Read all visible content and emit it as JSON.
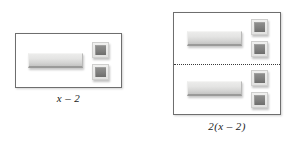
{
  "background_color": "#ffffff",
  "colors": {
    "panel_border": "#6e6e6e",
    "divider": "#3a3a3a",
    "bar_tile_fill": "#e4e4e3",
    "bar_tile_shadow_edge": "#9a9a99",
    "unit_tile_fill": "#7e7e7d",
    "unit_tile_frame": "#e2e2e1",
    "caption_text": "#1a1a1a"
  },
  "diagram": {
    "type": "algebra-tiles",
    "groups": [
      {
        "id": "group-left",
        "caption": "x – 2",
        "halves": 1,
        "divider": false,
        "tiles": {
          "bar_tiles": 1,
          "unit_tiles": 2
        }
      },
      {
        "id": "group-right",
        "caption": "2(x – 2)",
        "halves": 2,
        "divider": true,
        "tiles": {
          "bar_tiles": 2,
          "unit_tiles": 4
        },
        "per_half": {
          "bar_tiles": 1,
          "unit_tiles": 2
        }
      }
    ]
  },
  "left_group": {
    "caption": "x – 2",
    "bar_tile_label": "x-tile",
    "unit_tile_label": "unit-tile"
  },
  "right_group": {
    "caption": "2(x – 2)",
    "bar_tile_label": "x-tile",
    "unit_tile_label": "unit-tile"
  }
}
